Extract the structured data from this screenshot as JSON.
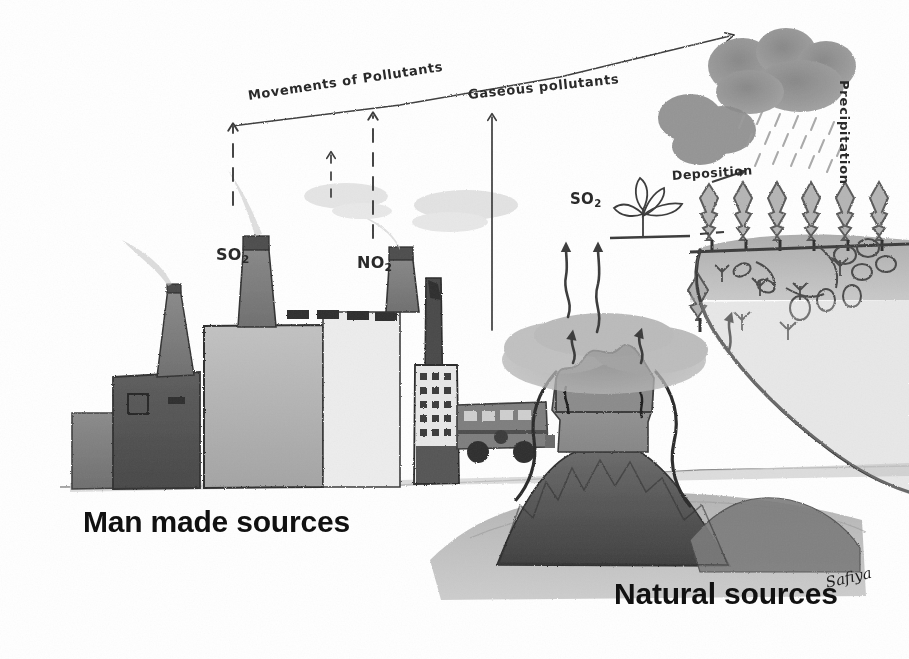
{
  "artwork": {
    "title_visible": false,
    "medium": "pencil-sketch",
    "captions": {
      "man_made": "Man made sources",
      "natural": "Natural sources"
    },
    "annotations": {
      "movement": "Movements of Pollutants",
      "gaseous": "Gaseous pollutants",
      "deposition": "Deposition",
      "precipitation": "Precipitation"
    },
    "chemical_labels": {
      "stack_so2": "SO",
      "stack_so2_sub": "2",
      "stack_no2": "NO",
      "stack_no2_sub": "2",
      "volcano_so2": "SO",
      "volcano_so2_sub": "2"
    },
    "signature": "Safiya",
    "colors": {
      "paper": "#ffffff",
      "pencil_dark": "#3a3a3a",
      "pencil_mid": "#7d7d7d",
      "pencil_light": "#b9b9b9",
      "ink": "#222222",
      "smoke": "#cfcfcf",
      "cloud_dark": "#8e8e8e",
      "ground": "#9a9a9a"
    }
  }
}
